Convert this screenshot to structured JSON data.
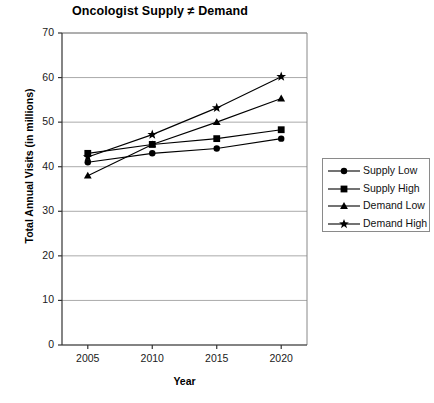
{
  "chart_data": {
    "type": "line",
    "title": "Oncologist Supply ≠ Demand",
    "xlabel": "Year",
    "ylabel": "Total Annual Visits (in millions)",
    "categories": [
      "2005",
      "2010",
      "2015",
      "2020"
    ],
    "x": [
      2005,
      2010,
      2015,
      2020
    ],
    "xlim": [
      2003,
      2022
    ],
    "ylim": [
      0,
      70
    ],
    "yticks": [
      0,
      10,
      20,
      30,
      40,
      50,
      60,
      70
    ],
    "ytick_labels": [
      "0",
      "10",
      "20",
      "30",
      "40",
      "50",
      "60",
      "70"
    ],
    "grid": "horizontal",
    "legend_position": "right",
    "series": [
      {
        "name": "Supply Low",
        "marker": "circle",
        "color": "#000000",
        "values": [
          41.0,
          43.0,
          44.1,
          46.3
        ]
      },
      {
        "name": "Supply High",
        "marker": "square",
        "color": "#000000",
        "values": [
          43.0,
          45.0,
          46.3,
          48.3
        ]
      },
      {
        "name": "Demand Low",
        "marker": "triangle",
        "color": "#000000",
        "values": [
          38.0,
          45.0,
          50.0,
          55.3
        ]
      },
      {
        "name": "Demand High",
        "marker": "star",
        "color": "#000000",
        "values": [
          42.2,
          47.2,
          53.2,
          60.2
        ]
      }
    ]
  },
  "legend": {
    "entries": [
      {
        "label": "Supply Low",
        "marker": "circle"
      },
      {
        "label": "Supply High",
        "marker": "square"
      },
      {
        "label": "Demand Low",
        "marker": "triangle"
      },
      {
        "label": "Demand High",
        "marker": "star"
      }
    ]
  }
}
